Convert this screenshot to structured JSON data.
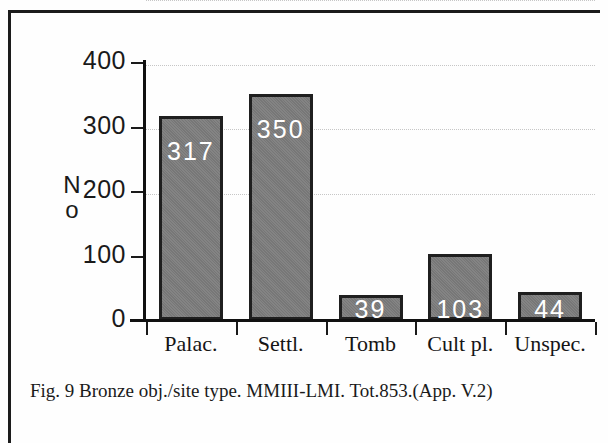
{
  "figure": {
    "caption": "Fig. 9  Bronze obj./site type. MMIII-LMI. Tot.853.(App. V.2)"
  },
  "chart_data": {
    "type": "bar",
    "title": "",
    "xlabel": "",
    "ylabel": "No",
    "categories": [
      "Palac.",
      "Settl.",
      "Tomb",
      "Cult pl.",
      "Unspec."
    ],
    "values": [
      317,
      350,
      39,
      103,
      44
    ],
    "value_labels": [
      "317",
      "350",
      "39",
      "103",
      "44"
    ],
    "ylim": [
      0,
      400
    ],
    "yticks": [
      0,
      100,
      200,
      300,
      400
    ],
    "ytick_labels": [
      "0",
      "100",
      "200",
      "300",
      "400"
    ],
    "grid": true,
    "grid_axis": "y",
    "legend": false,
    "total": 853,
    "bar_color": "#7d7d7d",
    "bar_edge_color": "#1f1f1f",
    "label_color": "#ffffff"
  },
  "axis": {
    "y_label_line1": "N",
    "y_label_line2": "o"
  }
}
